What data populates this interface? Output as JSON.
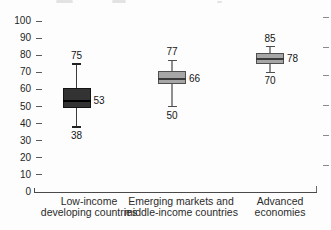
{
  "chart_data": {
    "type": "boxplot",
    "title": "",
    "xlabel": "",
    "ylabel": "",
    "ylim": [
      0,
      100
    ],
    "yticks": [
      0,
      10,
      20,
      30,
      40,
      50,
      60,
      70,
      80,
      90,
      100
    ],
    "grid": false,
    "legend": null,
    "colors": {
      "dark_box_fill": "#333333",
      "dark_box_border": "#141414",
      "gray_box_fill": "#a6a6a6",
      "gray_box_border": "#4f4f4f",
      "axis_line": "#4a4a4a",
      "tick_text": "#1f1f1f",
      "value_text": "#151515",
      "category_text": "#2b2b2b"
    },
    "series": [
      {
        "category_lines": [
          "Low-income",
          "developing countries"
        ],
        "whisker_low": 38,
        "q1": 49,
        "median": 53,
        "q3": 61,
        "whisker_high": 75,
        "box_fill": "#333333",
        "box_border": "#141414",
        "median_color": "#000000",
        "whisker_color": "#3c3c3c",
        "cap_color": "#222222"
      },
      {
        "category_lines": [
          "Emerging markets and",
          "middle-income countries"
        ],
        "whisker_low": 50,
        "q1": 63,
        "median": 66,
        "q3": 71,
        "whisker_high": 77,
        "box_fill": "#a6a6a6",
        "box_border": "#4f4f4f",
        "median_color": "#3a3a3a",
        "whisker_color": "#8f8f8f",
        "cap_color": "#4f4f4f"
      },
      {
        "category_lines": [
          "Advanced",
          "economies"
        ],
        "whisker_low": 70,
        "q1": 75,
        "median": 78,
        "q3": 81,
        "whisker_high": 85,
        "box_fill": "#a6a6a6",
        "box_border": "#4f4f4f",
        "median_color": "#3a3a3a",
        "whisker_color": "#8f8f8f",
        "cap_color": "#4f4f4f"
      }
    ]
  }
}
